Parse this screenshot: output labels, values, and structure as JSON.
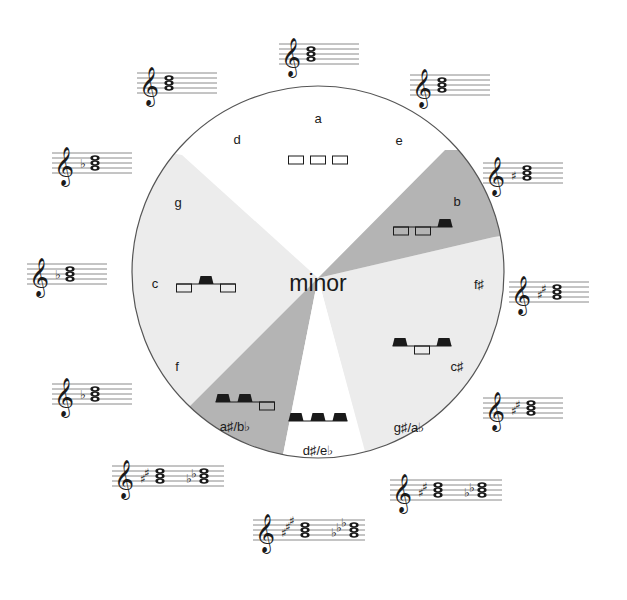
{
  "title": "minor",
  "colors": {
    "circle_stroke": "#555555",
    "light_wedge": "#ececec",
    "dark_wedge": "#b5b5b5",
    "white_wedge": "#ffffff",
    "staff_line": "#8a8a8a",
    "ink": "#1a1a1a"
  },
  "keys": [
    {
      "name": "a",
      "x": 318,
      "y": 118
    },
    {
      "name": "e",
      "x": 399,
      "y": 140
    },
    {
      "name": "b",
      "x": 457,
      "y": 201
    },
    {
      "name": "f♯",
      "x": 479,
      "y": 284
    },
    {
      "name": "c♯",
      "x": 457,
      "y": 366
    },
    {
      "name": "g♯/a♭",
      "x": 409,
      "y": 427
    },
    {
      "name": "d♯/e♭",
      "x": 318,
      "y": 450
    },
    {
      "name": "a♯/b♭",
      "x": 235,
      "y": 426
    },
    {
      "name": "f",
      "x": 177,
      "y": 366
    },
    {
      "name": "c",
      "x": 155,
      "y": 283
    },
    {
      "name": "g",
      "x": 178,
      "y": 202
    },
    {
      "name": "d",
      "x": 237,
      "y": 139
    }
  ],
  "key_patterns": [
    {
      "id": "a",
      "keys": [
        "white",
        "white",
        "white"
      ],
      "x": 318,
      "y": 156
    },
    {
      "id": "b",
      "keys": [
        "white",
        "white",
        "black"
      ],
      "x": 423,
      "y": 227
    },
    {
      "id": "c",
      "keys": [
        "white",
        "black",
        "white"
      ],
      "x": 206,
      "y": 284
    },
    {
      "id": "c-sharp",
      "keys": [
        "black",
        "white",
        "black"
      ],
      "x": 422,
      "y": 346
    },
    {
      "id": "a-sharp",
      "keys": [
        "black",
        "black",
        "white"
      ],
      "x": 245,
      "y": 402
    },
    {
      "id": "d-sharp",
      "keys": [
        "black",
        "black",
        "black"
      ],
      "x": 318,
      "y": 421
    }
  ],
  "staves": [
    {
      "id": "a-minor",
      "chord": "A C E",
      "accidentals": [],
      "x": 287,
      "y": 44
    },
    {
      "id": "e-minor",
      "chord": "E G B",
      "accidentals": [],
      "x": 418,
      "y": 75
    },
    {
      "id": "b-minor",
      "chord": "B D F♯",
      "accidentals": [
        "♯"
      ],
      "x": 491,
      "y": 163
    },
    {
      "id": "f-sharp-minor",
      "chord": "F♯ A C♯",
      "accidentals": [
        "♯",
        "♯"
      ],
      "x": 517,
      "y": 282
    },
    {
      "id": "c-sharp-minor",
      "chord": "C♯ E G♯",
      "accidentals": [
        "♯",
        "♯"
      ],
      "x": 491,
      "y": 398
    },
    {
      "id": "g-sharp-minor",
      "chord": "G♯ B D♯ / A♭ C♭ E♭",
      "accidentals": [
        "♯",
        "♯",
        "♭",
        "♭"
      ],
      "x": 398,
      "y": 480
    },
    {
      "id": "d-sharp-minor",
      "chord": "D♯ F♯ A♯ / E♭ G♭ B♭",
      "accidentals": [
        "♯",
        "♯",
        "♯",
        "♭",
        "♭",
        "♭"
      ],
      "x": 261,
      "y": 520
    },
    {
      "id": "a-sharp-minor",
      "chord": "A♯ C♯ E♯ / B♭ D♭ F",
      "accidentals": [
        "♯",
        "♯",
        "♭",
        "♭"
      ],
      "x": 120,
      "y": 466
    },
    {
      "id": "f-minor",
      "chord": "F A♭ C",
      "accidentals": [
        "♭"
      ],
      "x": 60,
      "y": 384
    },
    {
      "id": "c-minor",
      "chord": "C E♭ G",
      "accidentals": [
        "♭"
      ],
      "x": 35,
      "y": 264
    },
    {
      "id": "g-minor",
      "chord": "G B♭ D",
      "accidentals": [
        "♭"
      ],
      "x": 60,
      "y": 153
    },
    {
      "id": "d-minor",
      "chord": "D F A",
      "accidentals": [],
      "x": 145,
      "y": 73
    }
  ]
}
